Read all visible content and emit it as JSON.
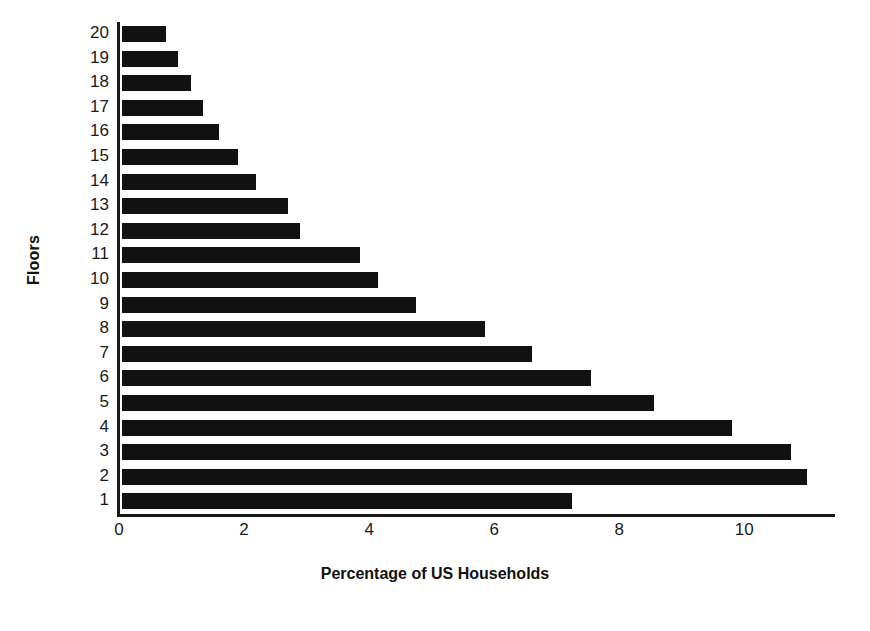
{
  "chart_data": {
    "type": "bar",
    "orientation": "horizontal",
    "title": "",
    "xlabel": "Percentage of US Households",
    "ylabel": "Floors",
    "categories": [
      "20",
      "19",
      "18",
      "17",
      "16",
      "15",
      "14",
      "13",
      "12",
      "11",
      "10",
      "9",
      "8",
      "7",
      "6",
      "5",
      "4",
      "3",
      "2",
      "1"
    ],
    "values": [
      0.7,
      0.9,
      1.1,
      1.3,
      1.55,
      1.85,
      2.15,
      2.65,
      2.85,
      3.8,
      4.1,
      4.7,
      5.8,
      6.55,
      7.5,
      8.5,
      9.75,
      10.7,
      10.95,
      7.2
    ],
    "xlim": [
      0,
      11.45
    ],
    "ylim": [
      0,
      20
    ],
    "xticks": [
      0,
      2,
      4,
      6,
      8,
      10
    ],
    "xtick_labels": [
      "0",
      "2",
      "4",
      "6",
      "8",
      "10"
    ],
    "grid": false,
    "legend": false,
    "bar_color": "#111111",
    "axis_color": "#1a1a1a",
    "background": "#ffffff"
  },
  "axes": {
    "y_title": "Floors",
    "x_title": "Percentage of US Households"
  }
}
